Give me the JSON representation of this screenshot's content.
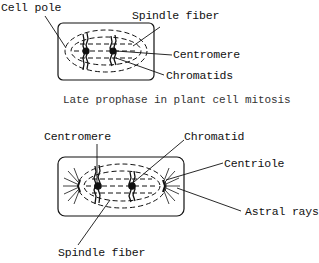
{
  "figure_top": {
    "title": "Late prophase in plant cell mitosis",
    "labels": {
      "cell_pole": "Cell pole",
      "spindle_fiber": "Spindle fiber",
      "centromere": "Centromere",
      "chromatids": "Chromatids"
    }
  },
  "figure_bottom": {
    "labels": {
      "centromere": "Centromere",
      "chromatid": "Chromatid",
      "centriole": "Centriole",
      "astral_rays": "Astral rays",
      "spindle_fiber": "Spindle fiber"
    }
  },
  "colors": {
    "ink": "#111111",
    "background": "#ffffff",
    "caption": "#333333"
  }
}
